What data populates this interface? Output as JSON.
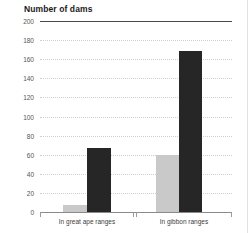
{
  "chart_data": {
    "type": "bar",
    "title": "Number of dams",
    "subtitle": "",
    "xlabel": "",
    "ylabel": "Number of dams",
    "categories": [
      "In great ape ranges",
      "In gibbon ranges"
    ],
    "series": [
      {
        "name": "light-series",
        "color": "#c9c9c9",
        "values": [
          7,
          59
        ]
      },
      {
        "name": "dark-series",
        "color": "#262626",
        "values": [
          66,
          168
        ]
      }
    ],
    "ylim": [
      0,
      200
    ],
    "ytick_step": 20,
    "yticks": [
      "200",
      "180",
      "160",
      "140",
      "120",
      "100",
      "80",
      "60",
      "40",
      "20",
      "0"
    ],
    "grid": "horizontal-dotted",
    "legend": "none"
  },
  "colors": {
    "light_bar": "#c9c9c9",
    "dark_bar": "#262626",
    "gridline": "#cfcfcf",
    "top_rule": "#4a4a4a",
    "baseline": "#8a8a8a",
    "text": "#3d3d3d",
    "background": "#ffffff"
  }
}
